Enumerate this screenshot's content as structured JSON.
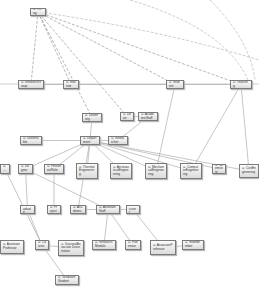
{
  "diagram": {
    "type": "ontology-class-graph",
    "nodes": [
      {
        "id": "thing",
        "label": "⊙ Thing"
      },
      {
        "id": "researchgroup",
        "label": "⊙ ResearchGroup"
      },
      {
        "id": "institute",
        "label": "⊙ Institute"
      },
      {
        "id": "student",
        "label": "⊙ Student"
      },
      {
        "id": "teaching",
        "label": "⊙ Teaching"
      },
      {
        "id": "university",
        "label": "⊙ University"
      },
      {
        "id": "dean",
        "label": "⊙ Dean"
      },
      {
        "id": "deliverable",
        "label": "⊙ Deliverable"
      },
      {
        "id": "department",
        "label": "⊙ Department"
      },
      {
        "id": "researcher",
        "label": "⊙ Researcher"
      },
      {
        "id": "academicstaff",
        "label": "⊙ AcademicStaff"
      },
      {
        "id": "degree",
        "label": "⊙ Degree"
      },
      {
        "id": "personnel",
        "label": "⊙ PersonnelRole"
      },
      {
        "id": "thermal",
        "label": "⊙ ThermalEngineering"
      },
      {
        "id": "aeronautical",
        "label": "⊙ AeronauticalEngineering"
      },
      {
        "id": "mechanical",
        "label": "⊙ MechanicalEngineering"
      },
      {
        "id": "computer",
        "label": "⊙ ComputerEngineering"
      },
      {
        "id": "chemistry",
        "label": "⊙ Chemistry"
      },
      {
        "id": "civil",
        "label": "⊙ CivilEngineering"
      },
      {
        "id": "leftcut1",
        "label": "⊙ ..."
      },
      {
        "id": "graduate",
        "label": "⊙ Graduate"
      },
      {
        "id": "project",
        "label": "⊙ Project"
      },
      {
        "id": "academic2",
        "label": "⊙ Academic"
      },
      {
        "id": "assistantstaff",
        "label": "⊙ AssistantStaff"
      },
      {
        "id": "lecturer",
        "label": "⊙ Lecturer"
      },
      {
        "id": "assistantprof",
        "label": "⊙ AssistantProfessor"
      },
      {
        "id": "course",
        "label": "⊙ Course"
      },
      {
        "id": "doctoral",
        "label": "⊙ DoctoralAssociate Dissertation"
      },
      {
        "id": "research2",
        "label": "⊙ ResearchModule"
      },
      {
        "id": "professor",
        "label": "⊙ Professor"
      },
      {
        "id": "associateprof",
        "label": "⊙ AssociateProfessor"
      },
      {
        "id": "staffmember",
        "label": "⊙ StaffMember"
      },
      {
        "id": "graduatestudent",
        "label": "⊙ GraduateStudent"
      }
    ],
    "edges": [
      [
        "thing",
        "researchgroup"
      ],
      [
        "thing",
        "institute"
      ],
      [
        "thing",
        "student"
      ],
      [
        "thing",
        "teaching"
      ],
      [
        "thing",
        "university"
      ],
      [
        "thing",
        "dean"
      ],
      [
        "institute",
        "researchgroup"
      ],
      [
        "institute",
        "student"
      ],
      [
        "student",
        "teaching"
      ],
      [
        "university",
        "department"
      ],
      [
        "dean",
        "academicstaff"
      ],
      [
        "department",
        "deliverable"
      ],
      [
        "department",
        "researcher"
      ],
      [
        "department",
        "degree"
      ],
      [
        "department",
        "personnel"
      ],
      [
        "department",
        "thermal"
      ],
      [
        "department",
        "aeronautical"
      ],
      [
        "department",
        "mechanical"
      ],
      [
        "department",
        "computer"
      ],
      [
        "department",
        "chemistry"
      ],
      [
        "department",
        "civil"
      ],
      [
        "researcher",
        "academicstaff"
      ],
      [
        "degree",
        "graduate"
      ],
      [
        "personnel",
        "project"
      ],
      [
        "department",
        "academic2"
      ],
      [
        "assistantstaff",
        "lecturer"
      ],
      [
        "academic2",
        "assistantstaff"
      ],
      [
        "graduate",
        "course"
      ],
      [
        "assistantstaff",
        "research2"
      ],
      [
        "assistantstaff",
        "professor"
      ],
      [
        "lecturer",
        "associateprof"
      ],
      [
        "associateprof",
        "staffmember"
      ],
      [
        "course",
        "doctoral"
      ],
      [
        "course",
        "graduatestudent"
      ],
      [
        "degree",
        "assistantstaff"
      ],
      [
        "leftcut1",
        "course"
      ],
      [
        "teaching",
        "computer"
      ],
      [
        "teaching",
        "civil"
      ],
      [
        "student",
        "mechanical"
      ]
    ]
  }
}
